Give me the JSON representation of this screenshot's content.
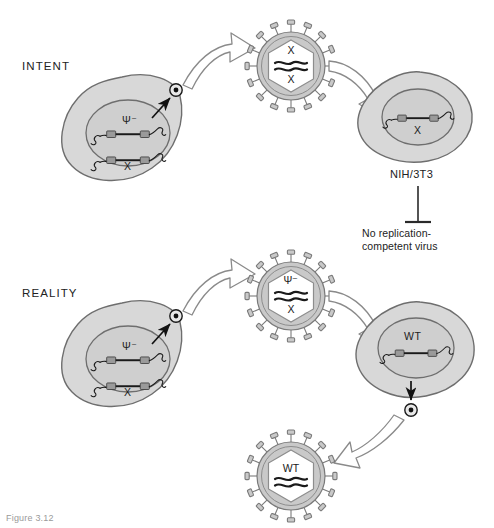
{
  "figure": {
    "title_caption": "Figure 3.12",
    "rows": [
      {
        "id": "intent",
        "label": "INTENT"
      },
      {
        "id": "reality",
        "label": "REALITY"
      }
    ],
    "intent": {
      "producer_cell": {
        "name": "producer-cell",
        "constructs": [
          {
            "label": "Ψ⁻",
            "label_position": "above"
          },
          {
            "label": "X",
            "label_position": "below"
          }
        ]
      },
      "virion": {
        "name": "vector-virion",
        "top_label": "X",
        "bottom_label": "X",
        "rna_strands": 2,
        "spikes": 16
      },
      "target_cell": {
        "name": "nih3t3-cell",
        "cell_line": "NIH/3T3",
        "constructs": [
          {
            "label": "X",
            "label_position": "below"
          }
        ]
      },
      "outcome": {
        "text_line1": "No replication-",
        "text_line2": "competent virus",
        "arrow_type": "inhibition"
      }
    },
    "reality": {
      "producer_cell": {
        "name": "producer-cell",
        "constructs": [
          {
            "label": "Ψ⁻",
            "label_position": "above"
          },
          {
            "label": "X",
            "label_position": "below"
          }
        ]
      },
      "virion": {
        "name": "recombinant-virion",
        "top_label": "Ψ⁻",
        "bottom_label": "X",
        "rna_strands": 2,
        "spikes": 16
      },
      "target_cell": {
        "name": "wt-infected-cell",
        "constructs": [
          {
            "label": "WT",
            "label_position": "above"
          }
        ]
      },
      "progeny_virion": {
        "name": "wild-type-virion",
        "top_label": "WT",
        "rna_strands": 2,
        "spikes": 16
      }
    },
    "colors": {
      "cell_fill": "#d8d8d8",
      "cell_stroke": "#6e6e6e",
      "nucleus_fill": "#cfcfcf",
      "nucleus_stroke": "#6e6e6e",
      "envelope_fill": "#c9c9c9",
      "envelope_stroke": "#7a7a7a",
      "capsid_fill": "#ffffff",
      "ltr_fill": "#9a9a9a",
      "dna_stroke": "#1a1a1a",
      "arrow_fill": "#ffffff",
      "arrow_stroke": "#8a8a8a",
      "text": "#222222"
    }
  }
}
